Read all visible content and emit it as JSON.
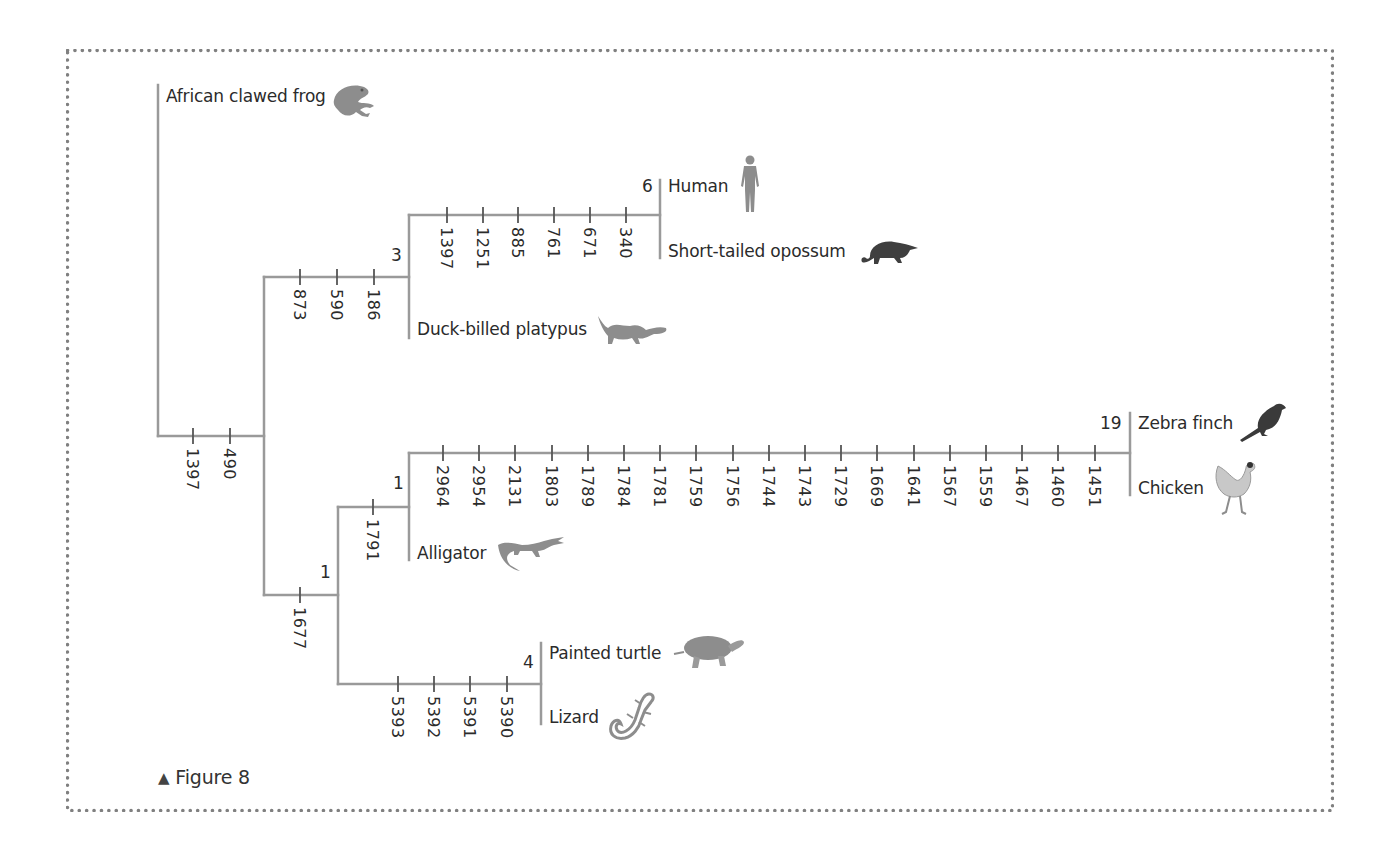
{
  "figure": {
    "caption": "Figure 8",
    "caption_marker": "▲",
    "frame_style": "dotted",
    "colors": {
      "line": "#9a9a9a",
      "text": "#2b2b2b",
      "border_dots": "#808080",
      "icon_gray": "#8d8d8d",
      "icon_dark": "#3a3a3a"
    }
  },
  "tree": {
    "taxa": [
      {
        "id": "frog",
        "label": "African clawed frog",
        "icon": "frog-icon"
      },
      {
        "id": "human",
        "label": "Human",
        "icon": "human-icon"
      },
      {
        "id": "opossum",
        "label": "Short-tailed opossum",
        "icon": "opossum-icon"
      },
      {
        "id": "platypus",
        "label": "Duck-billed platypus",
        "icon": "platypus-icon"
      },
      {
        "id": "finch",
        "label": "Zebra finch",
        "icon": "bird-icon"
      },
      {
        "id": "chicken",
        "label": "Chicken",
        "icon": "chicken-icon"
      },
      {
        "id": "alligator",
        "label": "Alligator",
        "icon": "alligator-icon"
      },
      {
        "id": "turtle",
        "label": "Painted turtle",
        "icon": "turtle-icon"
      },
      {
        "id": "lizard",
        "label": "Lizard",
        "icon": "lizard-icon"
      }
    ],
    "node_counts": {
      "human_opossum": "6",
      "mammals": "3",
      "finch_chicken": "19",
      "archosaurs": "1",
      "reptiles": "1",
      "turtle_lizard": "4"
    },
    "branches": {
      "root": {
        "ticks": [
          "1397",
          "490"
        ]
      },
      "mammals": {
        "ticks": [
          "873",
          "590",
          "186"
        ]
      },
      "therians": {
        "ticks": [
          "1397",
          "1251",
          "885",
          "761",
          "671",
          "340"
        ]
      },
      "reptiles": {
        "ticks": [
          "1677"
        ]
      },
      "archosaurs": {
        "ticks": [
          "1791"
        ]
      },
      "birds": {
        "ticks": [
          "2964",
          "2954",
          "2131",
          "1803",
          "1789",
          "1784",
          "1781",
          "1759",
          "1756",
          "1744",
          "1743",
          "1729",
          "1669",
          "1641",
          "1567",
          "1559",
          "1467",
          "1460",
          "1451"
        ]
      },
      "lepidosaur_turtle": {
        "ticks": [
          "5393",
          "5392",
          "5391",
          "5390"
        ]
      }
    }
  }
}
